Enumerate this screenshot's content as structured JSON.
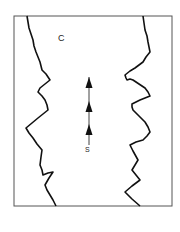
{
  "figure": {
    "type": "schematic channel diagram",
    "frame": {
      "x": 14,
      "y": 16,
      "width": 158,
      "height": 190,
      "stroke": "#555555"
    },
    "trace_color": "#111111",
    "labels": {
      "region": "C",
      "source": "S"
    },
    "left_boundary": [
      [
        27,
        16
      ],
      [
        28,
        22
      ],
      [
        29,
        28
      ],
      [
        31,
        34
      ],
      [
        33,
        40
      ],
      [
        34,
        46
      ],
      [
        36,
        52
      ],
      [
        38,
        57
      ],
      [
        40,
        62
      ],
      [
        41,
        66
      ],
      [
        42,
        70
      ],
      [
        46,
        74
      ],
      [
        50,
        80
      ],
      [
        45,
        84
      ],
      [
        40,
        88
      ],
      [
        38,
        92
      ],
      [
        42,
        96
      ],
      [
        45,
        100
      ],
      [
        47,
        105
      ],
      [
        48,
        110
      ],
      [
        43,
        114
      ],
      [
        38,
        118
      ],
      [
        32,
        123
      ],
      [
        26,
        128
      ],
      [
        29,
        133
      ],
      [
        33,
        138
      ],
      [
        37,
        144
      ],
      [
        42,
        150
      ],
      [
        41,
        157
      ],
      [
        40,
        165
      ],
      [
        42,
        170
      ],
      [
        43,
        175
      ],
      [
        48,
        173
      ],
      [
        53,
        172
      ],
      [
        49,
        178
      ],
      [
        45,
        185
      ],
      [
        47,
        190
      ],
      [
        50,
        195
      ],
      [
        53,
        200
      ],
      [
        56,
        206
      ]
    ],
    "right_boundary": [
      [
        143,
        16
      ],
      [
        144,
        23
      ],
      [
        145,
        30
      ],
      [
        147,
        36
      ],
      [
        148,
        42
      ],
      [
        149,
        47
      ],
      [
        150,
        52
      ],
      [
        146,
        57
      ],
      [
        143,
        62
      ],
      [
        139,
        65
      ],
      [
        135,
        68
      ],
      [
        130,
        71
      ],
      [
        125,
        75
      ],
      [
        126,
        78
      ],
      [
        127,
        80
      ],
      [
        130,
        79
      ],
      [
        133,
        80
      ],
      [
        139,
        84
      ],
      [
        145,
        88
      ],
      [
        148,
        92
      ],
      [
        150,
        96
      ],
      [
        145,
        98
      ],
      [
        140,
        100
      ],
      [
        136,
        102
      ],
      [
        132,
        104
      ],
      [
        132,
        107
      ],
      [
        133,
        110
      ],
      [
        139,
        116
      ],
      [
        145,
        122
      ],
      [
        148,
        127
      ],
      [
        150,
        132
      ],
      [
        147,
        136
      ],
      [
        143,
        140
      ],
      [
        136,
        142
      ],
      [
        130,
        145
      ],
      [
        133,
        151
      ],
      [
        138,
        160
      ],
      [
        135,
        165
      ],
      [
        132,
        170
      ],
      [
        136,
        175
      ],
      [
        140,
        180
      ],
      [
        132,
        186
      ],
      [
        125,
        192
      ],
      [
        132,
        199
      ],
      [
        140,
        206
      ]
    ],
    "arrows": [
      {
        "x": 89,
        "tip_y": 77,
        "direction": "up"
      },
      {
        "x": 89,
        "tip_y": 101,
        "direction": "up"
      },
      {
        "x": 89,
        "tip_y": 124,
        "direction": "up"
      }
    ],
    "arrow_stem": {
      "x": 89,
      "y_top": 77,
      "y_bottom": 145
    }
  }
}
